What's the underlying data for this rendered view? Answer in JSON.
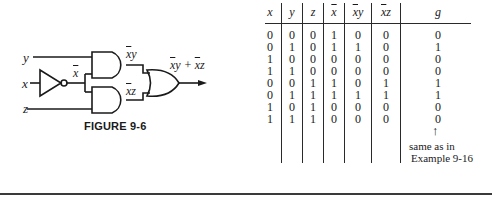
{
  "figure": {
    "caption": "FIGURE 9-6",
    "inputs": {
      "y": "y",
      "x": "x",
      "z": "z"
    },
    "wire_labels": {
      "not_x": "x",
      "and_top": "xy",
      "and_bottom": "xz",
      "output": "xy + xz"
    },
    "gates": [
      "NOT",
      "AND",
      "AND",
      "OR"
    ]
  },
  "truth_table": {
    "headers": [
      "x",
      "y",
      "z",
      "x̄",
      "x̄y",
      "x̄z",
      "g"
    ],
    "rows": [
      [
        "0",
        "0",
        "0",
        "1",
        "0",
        "0",
        "0"
      ],
      [
        "0",
        "1",
        "0",
        "1",
        "1",
        "0",
        "1"
      ],
      [
        "1",
        "0",
        "0",
        "0",
        "0",
        "0",
        "0"
      ],
      [
        "1",
        "1",
        "0",
        "0",
        "0",
        "0",
        "0"
      ],
      [
        "0",
        "0",
        "1",
        "1",
        "0",
        "1",
        "1"
      ],
      [
        "0",
        "1",
        "1",
        "1",
        "1",
        "1",
        "1"
      ],
      [
        "1",
        "0",
        "1",
        "0",
        "0",
        "0",
        "0"
      ],
      [
        "1",
        "1",
        "1",
        "0",
        "0",
        "0",
        "0"
      ]
    ],
    "arrow": "↑",
    "note_line1": "same as in",
    "note_line2": "Example 9-16"
  }
}
